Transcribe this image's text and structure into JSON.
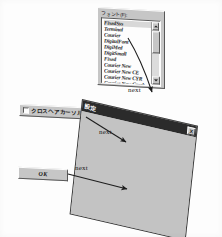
{
  "figure": {
    "caption_words": [
      "next",
      "next",
      "next"
    ]
  },
  "font_picker": {
    "label": "フォント(F):",
    "items": [
      {
        "name": "FixedSys",
        "selected": true
      },
      {
        "name": "Terminal",
        "selected": false
      },
      {
        "name": "Courier",
        "selected": false
      },
      {
        "name": "DigitalFont",
        "selected": false
      },
      {
        "name": "DigiMed",
        "selected": false
      },
      {
        "name": "DigitSmall",
        "selected": false
      },
      {
        "name": "Fixed",
        "selected": false
      },
      {
        "name": "Courier New",
        "selected": false
      },
      {
        "name": "Courier New CE",
        "selected": false
      },
      {
        "name": "Courier New CYR",
        "selected": false
      },
      {
        "name": "Courier New Greek",
        "selected": false
      }
    ],
    "scrollbar": {
      "up_arrow": "▲",
      "down_arrow": "▼"
    }
  },
  "checkbox": {
    "label": "クロスヘアカーソルを表示",
    "checked": false
  },
  "ok_button": {
    "label": "OK"
  },
  "target_dialog": {
    "title": "設定",
    "close_label": "X"
  },
  "arrows": {
    "label_1": "next",
    "label_2": "next",
    "label_3": "next"
  },
  "colors": {
    "face": "#c6c6c6",
    "titlebar": "#2b2b2b",
    "text": "#1a1a1a",
    "highlight": "#fdfdfd",
    "shadow": "#585858"
  }
}
